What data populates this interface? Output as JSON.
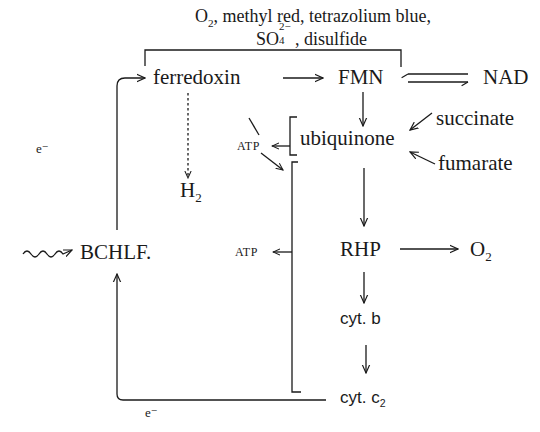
{
  "title": {
    "line1_prefix": "O",
    "line1_prefix_sub": "2",
    "line1_rest": ", methyl red, tetrazolium blue,",
    "line2_prefix": "SO",
    "line2_sup": "2−",
    "line2_sub": "4",
    "line2_rest": ", disulfide"
  },
  "nodes": {
    "ferredoxin": "ferredoxin",
    "fmn": "FMN",
    "nad": "NAD",
    "atp_upper": "ATP",
    "atp_lower": "ATP",
    "ubiquinone": "ubiquinone",
    "succinate": "succinate",
    "fumarate": "fumarate",
    "h2": "H",
    "h2_sub": "2",
    "bchlf": "BCHLF.",
    "rhp": "RHP",
    "o2": "O",
    "o2_sub": "2",
    "cyt_b": "cyt. b",
    "cyt_c2": "cyt. c",
    "cyt_c2_sub": "2"
  },
  "labels": {
    "electron_top": "e⁻",
    "electron_bottom": "e⁻"
  },
  "colors": {
    "ink": "#1a1a1a",
    "background": "#ffffff"
  }
}
